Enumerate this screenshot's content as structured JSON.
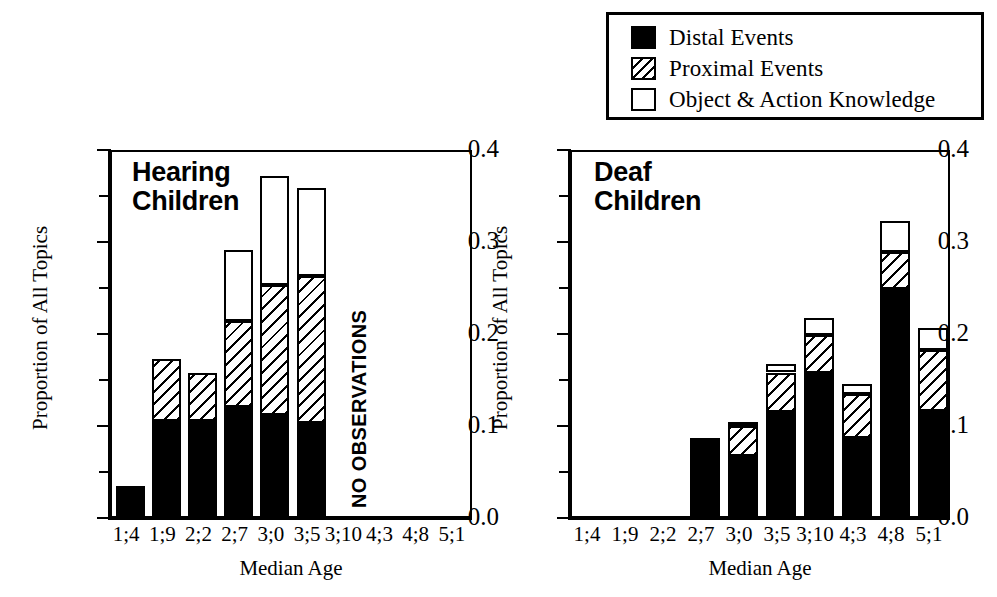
{
  "legend": {
    "items": [
      {
        "label": "Distal Events",
        "swatch": "solid-black-swatch",
        "color": "#000000"
      },
      {
        "label": "Proximal Events",
        "swatch": "diagonal-hatch-swatch",
        "color": "#000000"
      },
      {
        "label": "Object & Action Knowledge",
        "swatch": "open-white-swatch",
        "color": "#ffffff"
      }
    ]
  },
  "axes": {
    "ylabel": "Proportion of All Topics",
    "xlabel": "Median Age",
    "ytick_labels": [
      "0.0",
      "0.1",
      "0.2",
      "0.3",
      "0.4"
    ],
    "ylim": [
      0.0,
      0.4
    ],
    "categories": [
      "1;4",
      "1;9",
      "2;2",
      "2;7",
      "3;0",
      "3;5",
      "3;10",
      "4;3",
      "4;8",
      "5;1"
    ]
  },
  "panels": [
    {
      "id": "hearing",
      "title": "Hearing\nChildren",
      "title_line1": "Hearing",
      "title_line2": "Children",
      "annotation": "NO OBSERVATIONS"
    },
    {
      "id": "deaf",
      "title_line1": "Deaf",
      "title_line2": "Children",
      "annotation": ""
    }
  ],
  "chart_data": [
    {
      "type": "bar",
      "stacked": true,
      "title": "Hearing Children",
      "xlabel": "Median Age",
      "ylabel": "Proportion of All Topics",
      "ylim": [
        0.0,
        0.4
      ],
      "yticks": [
        0.0,
        0.1,
        0.2,
        0.3,
        0.4
      ],
      "grid": false,
      "legend_position": "top-right-outside",
      "categories": [
        "1;4",
        "1;9",
        "2;2",
        "2;7",
        "3;0",
        "3;5",
        "3;10",
        "4;3",
        "4;8",
        "5;1"
      ],
      "series": [
        {
          "name": "Distal Events",
          "values": [
            0.033,
            0.103,
            0.103,
            0.118,
            0.11,
            0.101,
            null,
            null,
            null,
            null
          ]
        },
        {
          "name": "Proximal Events",
          "values": [
            0.0,
            0.068,
            0.052,
            0.094,
            0.141,
            0.16,
            null,
            null,
            null,
            null
          ]
        },
        {
          "name": "Object & Action Knowledge",
          "values": [
            0.0,
            0.0,
            0.0,
            0.077,
            0.119,
            0.096,
            null,
            null,
            null,
            null
          ]
        }
      ],
      "totals": [
        0.033,
        0.171,
        0.155,
        0.289,
        0.37,
        0.357,
        null,
        null,
        null,
        null
      ],
      "annotation": "NO OBSERVATIONS",
      "annotation_categories": [
        "3;10",
        "4;3",
        "4;8",
        "5;1"
      ]
    },
    {
      "type": "bar",
      "stacked": true,
      "title": "Deaf Children",
      "xlabel": "Median Age",
      "ylabel": "Proportion of All Topics",
      "ylim": [
        0.0,
        0.4
      ],
      "yticks": [
        0.0,
        0.1,
        0.2,
        0.3,
        0.4
      ],
      "grid": false,
      "legend_position": "top-right-outside",
      "categories": [
        "1;4",
        "1;9",
        "2;2",
        "2;7",
        "3;0",
        "3;5",
        "3;10",
        "4;3",
        "4;8",
        "5;1"
      ],
      "series": [
        {
          "name": "Distal Events",
          "values": [
            null,
            null,
            null,
            0.085,
            0.065,
            0.113,
            0.155,
            0.085,
            0.247,
            0.114
          ]
        },
        {
          "name": "Proximal Events",
          "values": [
            null,
            null,
            null,
            0.0,
            0.033,
            0.043,
            0.042,
            0.048,
            0.04,
            0.066
          ]
        },
        {
          "name": "Object & Action Knowledge",
          "values": [
            null,
            null,
            null,
            0.0,
            0.002,
            0.009,
            0.018,
            0.01,
            0.034,
            0.024
          ]
        }
      ],
      "totals": [
        null,
        null,
        null,
        0.085,
        0.1,
        0.165,
        0.215,
        0.143,
        0.321,
        0.204
      ],
      "annotation": "",
      "annotation_categories": []
    }
  ]
}
